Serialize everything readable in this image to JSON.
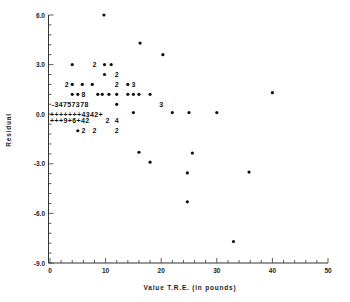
{
  "chart_data": {
    "type": "scatter",
    "title": "",
    "xlabel": "Value T.R.E. (in pounds)",
    "ylabel": "Residual",
    "xlim": [
      0,
      50
    ],
    "ylim": [
      -9.0,
      6.0
    ],
    "x_ticks": [
      "0",
      "10",
      "20",
      "30",
      "40",
      "50"
    ],
    "y_ticks": [
      "6.0",
      "3.0",
      "0.0",
      "-3.0",
      "-6.0",
      "-9.0"
    ],
    "grid": false,
    "legend": null,
    "note": "Printer-style residual plot; digits/'+' indicate multiple overlapping observations, '*' a single observation",
    "points": [
      {
        "x": 9.7,
        "y": 6.0,
        "mark": "*"
      },
      {
        "x": 16.2,
        "y": 4.3,
        "mark": "*"
      },
      {
        "x": 20.3,
        "y": 3.6,
        "mark": "*"
      },
      {
        "x": 4.0,
        "y": 3.0,
        "mark": "*"
      },
      {
        "x": 8.0,
        "y": 3.0,
        "mark": "2"
      },
      {
        "x": 9.8,
        "y": 3.0,
        "mark": "*"
      },
      {
        "x": 11.0,
        "y": 3.0,
        "mark": "*"
      },
      {
        "x": 9.8,
        "y": 2.4,
        "mark": "*"
      },
      {
        "x": 12.0,
        "y": 2.4,
        "mark": "2"
      },
      {
        "x": 3.0,
        "y": 1.8,
        "mark": "2"
      },
      {
        "x": 4.0,
        "y": 1.8,
        "mark": "*"
      },
      {
        "x": 5.8,
        "y": 1.8,
        "mark": "*"
      },
      {
        "x": 7.6,
        "y": 1.8,
        "mark": "*"
      },
      {
        "x": 12.0,
        "y": 1.8,
        "mark": "2"
      },
      {
        "x": 14.0,
        "y": 1.8,
        "mark": "*"
      },
      {
        "x": 15.0,
        "y": 1.8,
        "mark": "3"
      },
      {
        "x": 4.0,
        "y": 1.2,
        "mark": "*"
      },
      {
        "x": 5.0,
        "y": 1.2,
        "mark": "*"
      },
      {
        "x": 6.0,
        "y": 1.2,
        "mark": "8"
      },
      {
        "x": 8.6,
        "y": 1.2,
        "mark": "*"
      },
      {
        "x": 9.4,
        "y": 1.2,
        "mark": "*"
      },
      {
        "x": 10.6,
        "y": 1.2,
        "mark": "*"
      },
      {
        "x": 12.0,
        "y": 1.2,
        "mark": "*"
      },
      {
        "x": 14.0,
        "y": 1.2,
        "mark": "*"
      },
      {
        "x": 15.0,
        "y": 1.2,
        "mark": "*"
      },
      {
        "x": 16.0,
        "y": 1.2,
        "mark": "*"
      },
      {
        "x": 18.0,
        "y": 1.2,
        "mark": "*"
      },
      {
        "x": 12.0,
        "y": 0.6,
        "mark": "*"
      },
      {
        "x": 20.0,
        "y": 0.6,
        "mark": "3"
      },
      {
        "x": 40.0,
        "y": 1.3,
        "mark": "*"
      },
      {
        "x": 15.0,
        "y": 0.1,
        "mark": "*"
      },
      {
        "x": 22.0,
        "y": 0.1,
        "mark": "*"
      },
      {
        "x": 25.0,
        "y": 0.1,
        "mark": "*"
      },
      {
        "x": 30.0,
        "y": 0.1,
        "mark": "*"
      },
      {
        "x": 12.0,
        "y": -0.4,
        "mark": "4"
      },
      {
        "x": 12.0,
        "y": -1.0,
        "mark": "2"
      },
      {
        "x": 5.0,
        "y": -1.0,
        "mark": "*"
      },
      {
        "x": 6.0,
        "y": -1.0,
        "mark": "2"
      },
      {
        "x": 8.0,
        "y": -1.0,
        "mark": "2"
      },
      {
        "x": 16.0,
        "y": -2.3,
        "mark": "*"
      },
      {
        "x": 18.0,
        "y": -2.9,
        "mark": "*"
      },
      {
        "x": 25.6,
        "y": -2.35,
        "mark": "*"
      },
      {
        "x": 24.7,
        "y": -3.55,
        "mark": "*"
      },
      {
        "x": 35.8,
        "y": -3.5,
        "mark": "*"
      },
      {
        "x": 24.7,
        "y": -5.3,
        "mark": "*"
      },
      {
        "x": 33.0,
        "y": -7.7,
        "mark": "*"
      }
    ],
    "text_rows": [
      {
        "y": 0.6,
        "x_start": 0.3,
        "text": "-34757378"
      },
      {
        "y": 0.0,
        "x_start": 0.0,
        "text": "+++++++4342+"
      },
      {
        "y": -0.4,
        "x_start": 0.0,
        "text": "+++9+6+42"
      },
      {
        "y": -0.4,
        "x_start": 10.0,
        "text": "2"
      }
    ]
  }
}
